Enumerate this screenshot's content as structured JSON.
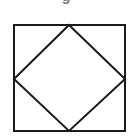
{
  "caption": {
    "text": "g",
    "note": "partially visible, cut off at top edge"
  },
  "figure": {
    "stroke_color": "#1a1a1a",
    "stroke_width": 2,
    "outer_square": {
      "x1": 14,
      "y1": 25,
      "x2": 125,
      "y2": 131
    },
    "inner_diamond": {
      "top": [
        69,
        25
      ],
      "right": [
        125,
        79
      ],
      "bottom": [
        69,
        131
      ],
      "left": [
        14,
        79
      ]
    }
  }
}
